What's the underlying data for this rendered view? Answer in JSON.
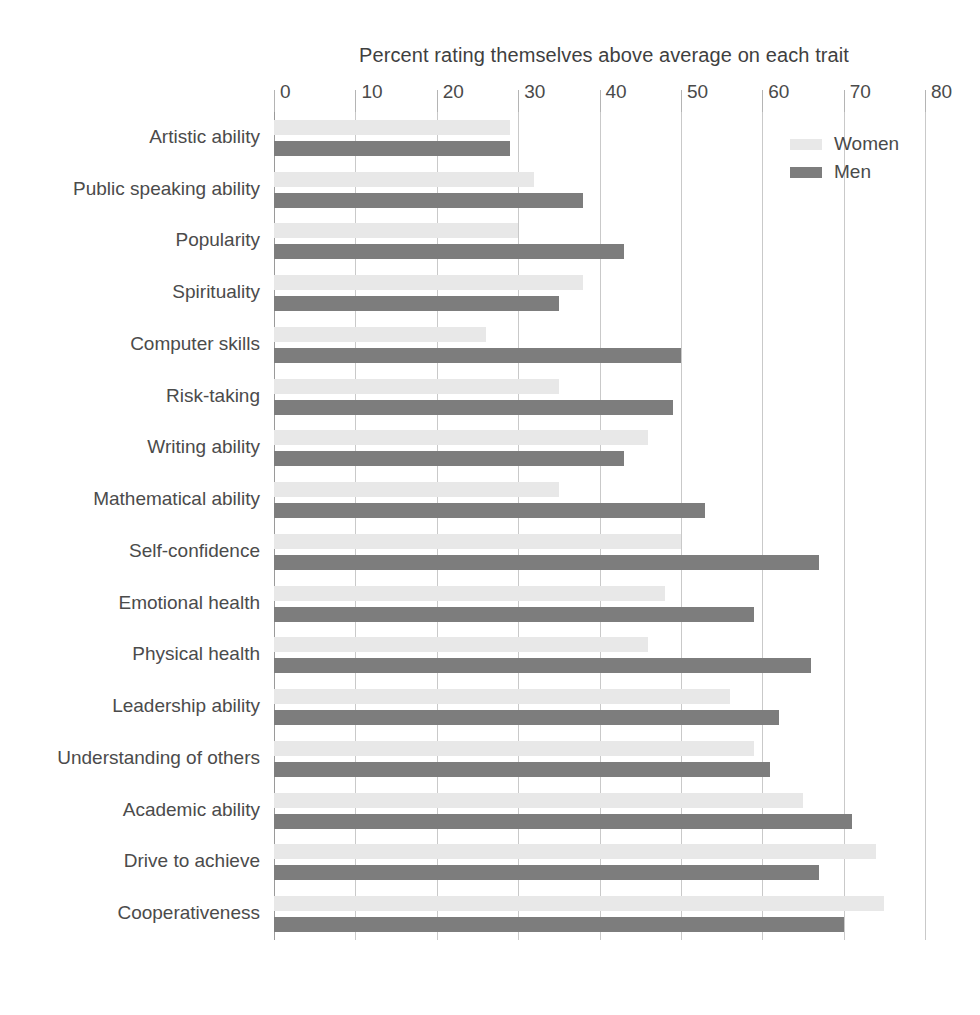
{
  "chart_data": {
    "type": "bar",
    "orientation": "horizontal",
    "title": "Percent rating themselves above average on each trait",
    "xlabel": "",
    "ylabel": "",
    "xlim": [
      0,
      80
    ],
    "xticks": [
      0,
      10,
      20,
      30,
      40,
      50,
      60,
      70,
      80
    ],
    "grid": true,
    "legend_position": "top-right",
    "categories": [
      "Artistic ability",
      "Public speaking ability",
      "Popularity",
      "Spirituality",
      "Computer skills",
      "Risk-taking",
      "Writing ability",
      "Mathematical ability",
      "Self-confidence",
      "Emotional health",
      "Physical health",
      "Leadership ability",
      "Understanding of others",
      "Academic ability",
      "Drive to achieve",
      "Cooperativeness"
    ],
    "series": [
      {
        "name": "Women",
        "color": "#e8e8e8",
        "values": [
          29,
          32,
          30,
          38,
          26,
          35,
          46,
          35,
          50,
          48,
          46,
          56,
          59,
          65,
          74,
          75
        ]
      },
      {
        "name": "Men",
        "color": "#7d7d7d",
        "values": [
          29,
          38,
          43,
          35,
          50,
          49,
          43,
          53,
          67,
          59,
          66,
          62,
          61,
          71,
          67,
          70
        ]
      }
    ]
  },
  "legend": {
    "items": [
      {
        "label": "Women",
        "color": "#e8e8e8"
      },
      {
        "label": "Men",
        "color": "#7d7d7d"
      }
    ]
  },
  "colors": {
    "women_bar": "#e8e8e8",
    "men_bar": "#7d7d7d",
    "gridline": "#c9c9c9",
    "text": "#4a4a4a",
    "background": "#ffffff"
  }
}
